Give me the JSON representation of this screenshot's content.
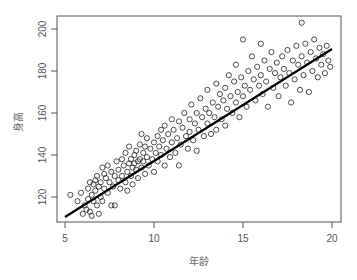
{
  "chart_data": {
    "type": "scatter",
    "title": "",
    "xlabel": "年龄",
    "ylabel": "身高",
    "xlim": [
      4.6,
      20.4
    ],
    "ylim": [
      106,
      206
    ],
    "xticks": [
      5,
      10,
      15,
      20
    ],
    "yticks": [
      120,
      140,
      160,
      180,
      200
    ],
    "grid": false,
    "legend": null,
    "marker": "open-circle",
    "regression_line": {
      "x": [
        5,
        20
      ],
      "y": [
        110.5,
        190.5
      ],
      "color": "#000000"
    },
    "points": [
      [
        5.3,
        121
      ],
      [
        5.7,
        118
      ],
      [
        5.9,
        122
      ],
      [
        6.0,
        112
      ],
      [
        6.1,
        116
      ],
      [
        6.2,
        114
      ],
      [
        6.3,
        124
      ],
      [
        6.3,
        119
      ],
      [
        6.4,
        127
      ],
      [
        6.4,
        113
      ],
      [
        6.5,
        121
      ],
      [
        6.5,
        111
      ],
      [
        6.6,
        126
      ],
      [
        6.6,
        118
      ],
      [
        6.7,
        128
      ],
      [
        6.7,
        123
      ],
      [
        6.8,
        116
      ],
      [
        6.8,
        130
      ],
      [
        6.9,
        125
      ],
      [
        6.9,
        112
      ],
      [
        7.0,
        120
      ],
      [
        7.0,
        127
      ],
      [
        7.1,
        134
      ],
      [
        7.1,
        118
      ],
      [
        7.2,
        131
      ],
      [
        7.2,
        124
      ],
      [
        7.3,
        129
      ],
      [
        7.4,
        122
      ],
      [
        7.4,
        135
      ],
      [
        7.5,
        127
      ],
      [
        7.6,
        116
      ],
      [
        7.6,
        132
      ],
      [
        7.7,
        125
      ],
      [
        7.8,
        130
      ],
      [
        7.8,
        116
      ],
      [
        7.9,
        137
      ],
      [
        8.0,
        128
      ],
      [
        8.0,
        133
      ],
      [
        8.1,
        124
      ],
      [
        8.2,
        138
      ],
      [
        8.2,
        130
      ],
      [
        8.3,
        135
      ],
      [
        8.4,
        127
      ],
      [
        8.4,
        141
      ],
      [
        8.5,
        132
      ],
      [
        8.5,
        123
      ],
      [
        8.6,
        136
      ],
      [
        8.6,
        144
      ],
      [
        8.7,
        130
      ],
      [
        8.7,
        138
      ],
      [
        8.8,
        134
      ],
      [
        8.8,
        126
      ],
      [
        8.9,
        140
      ],
      [
        8.9,
        136
      ],
      [
        9.0,
        133
      ],
      [
        9.0,
        142
      ],
      [
        9.1,
        137
      ],
      [
        9.1,
        129
      ],
      [
        9.2,
        145
      ],
      [
        9.2,
        138
      ],
      [
        9.3,
        134
      ],
      [
        9.3,
        150
      ],
      [
        9.4,
        141
      ],
      [
        9.4,
        137
      ],
      [
        9.5,
        131
      ],
      [
        9.5,
        144
      ],
      [
        9.6,
        139
      ],
      [
        9.6,
        148
      ],
      [
        9.7,
        135
      ],
      [
        9.8,
        143
      ],
      [
        9.9,
        138
      ],
      [
        10.0,
        146
      ],
      [
        10.0,
        132
      ],
      [
        10.1,
        141
      ],
      [
        10.2,
        149
      ],
      [
        10.2,
        137
      ],
      [
        10.3,
        144
      ],
      [
        10.4,
        152
      ],
      [
        10.4,
        140
      ],
      [
        10.5,
        147
      ],
      [
        10.6,
        135
      ],
      [
        10.6,
        154
      ],
      [
        10.7,
        143
      ],
      [
        10.8,
        150
      ],
      [
        10.9,
        139
      ],
      [
        11.0,
        157
      ],
      [
        11.0,
        146
      ],
      [
        11.1,
        152
      ],
      [
        11.2,
        141
      ],
      [
        11.3,
        148
      ],
      [
        11.4,
        156
      ],
      [
        11.4,
        135
      ],
      [
        11.5,
        145
      ],
      [
        11.6,
        153
      ],
      [
        11.7,
        160
      ],
      [
        11.8,
        149
      ],
      [
        11.9,
        143
      ],
      [
        12.0,
        157
      ],
      [
        12.0,
        151
      ],
      [
        12.1,
        164
      ],
      [
        12.2,
        147
      ],
      [
        12.3,
        155
      ],
      [
        12.4,
        160
      ],
      [
        12.4,
        142
      ],
      [
        12.5,
        152
      ],
      [
        12.6,
        167
      ],
      [
        12.7,
        158
      ],
      [
        12.8,
        149
      ],
      [
        12.9,
        162
      ],
      [
        13.0,
        155
      ],
      [
        13.0,
        171
      ],
      [
        13.1,
        160
      ],
      [
        13.2,
        150
      ],
      [
        13.3,
        165
      ],
      [
        13.4,
        158
      ],
      [
        13.5,
        174
      ],
      [
        13.5,
        152
      ],
      [
        13.6,
        163
      ],
      [
        13.7,
        169
      ],
      [
        13.8,
        157
      ],
      [
        13.9,
        166
      ],
      [
        14.0,
        172
      ],
      [
        14.0,
        154
      ],
      [
        14.1,
        162
      ],
      [
        14.2,
        178
      ],
      [
        14.3,
        168
      ],
      [
        14.4,
        160
      ],
      [
        14.5,
        175
      ],
      [
        14.6,
        165
      ],
      [
        14.6,
        183
      ],
      [
        14.7,
        170
      ],
      [
        14.8,
        158
      ],
      [
        14.9,
        177
      ],
      [
        15.0,
        168
      ],
      [
        15.0,
        195
      ],
      [
        15.1,
        173
      ],
      [
        15.2,
        163
      ],
      [
        15.3,
        180
      ],
      [
        15.4,
        171
      ],
      [
        15.5,
        187
      ],
      [
        15.6,
        176
      ],
      [
        15.7,
        166
      ],
      [
        15.8,
        182
      ],
      [
        15.9,
        173
      ],
      [
        16.0,
        193
      ],
      [
        16.0,
        178
      ],
      [
        16.1,
        169
      ],
      [
        16.2,
        185
      ],
      [
        16.3,
        175
      ],
      [
        16.4,
        163
      ],
      [
        16.5,
        181
      ],
      [
        16.6,
        189
      ],
      [
        16.7,
        172
      ],
      [
        16.8,
        179
      ],
      [
        16.9,
        184
      ],
      [
        17.0,
        168
      ],
      [
        17.1,
        177
      ],
      [
        17.2,
        187
      ],
      [
        17.3,
        181
      ],
      [
        17.4,
        173
      ],
      [
        17.5,
        190
      ],
      [
        17.6,
        179
      ],
      [
        17.7,
        165
      ],
      [
        17.8,
        185
      ],
      [
        17.9,
        176
      ],
      [
        18.0,
        192
      ],
      [
        18.1,
        183
      ],
      [
        18.2,
        171
      ],
      [
        18.3,
        203
      ],
      [
        18.3,
        187
      ],
      [
        18.4,
        178
      ],
      [
        18.5,
        193
      ],
      [
        18.6,
        184
      ],
      [
        18.7,
        170
      ],
      [
        18.8,
        189
      ],
      [
        18.9,
        180
      ],
      [
        19.0,
        195
      ],
      [
        19.1,
        186
      ],
      [
        19.2,
        177
      ],
      [
        19.3,
        191
      ],
      [
        19.4,
        183
      ],
      [
        19.5,
        188
      ],
      [
        19.6,
        179
      ],
      [
        19.7,
        192
      ],
      [
        19.8,
        185
      ],
      [
        19.9,
        182
      ]
    ]
  },
  "axes": {
    "x_tick_labels": [
      "5",
      "10",
      "15",
      "20"
    ],
    "y_tick_labels": [
      "120",
      "140",
      "160",
      "180",
      "200"
    ],
    "x_title": "年龄",
    "y_title": "身高"
  }
}
